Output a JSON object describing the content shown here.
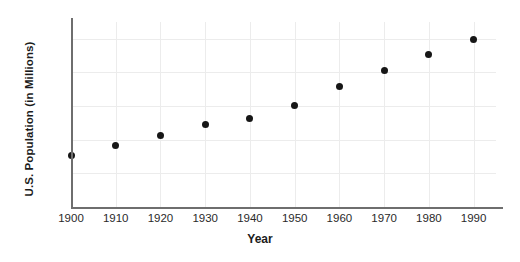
{
  "chart_data": {
    "type": "scatter",
    "title": "",
    "xlabel": "Year",
    "ylabel": "U.S. Population (in Millions)",
    "x": [
      1900,
      1910,
      1920,
      1930,
      1940,
      1950,
      1960,
      1970,
      1980,
      1990
    ],
    "values": [
      76,
      92,
      106,
      123,
      132,
      151,
      179,
      203,
      227,
      249
    ],
    "categories": [
      "1900",
      "1910",
      "1920",
      "1930",
      "1940",
      "1950",
      "1960",
      "1970",
      "1980",
      "1990"
    ],
    "xlim": [
      1900,
      1995
    ],
    "ylim": [
      0,
      275
    ],
    "xticks": [
      "1900",
      "1910",
      "1920",
      "1930",
      "1940",
      "1950",
      "1960",
      "1970",
      "1980",
      "1990"
    ],
    "yticks": [
      "0",
      "50",
      "100",
      "150",
      "200",
      "250"
    ],
    "ytick_values": [
      0,
      50,
      100,
      150,
      200,
      250
    ],
    "grid": "both",
    "legend": "none",
    "marker_color": "#161616",
    "axis_color": "#6e6e6e",
    "grid_color": "#ececec",
    "background": "#ffffff"
  }
}
